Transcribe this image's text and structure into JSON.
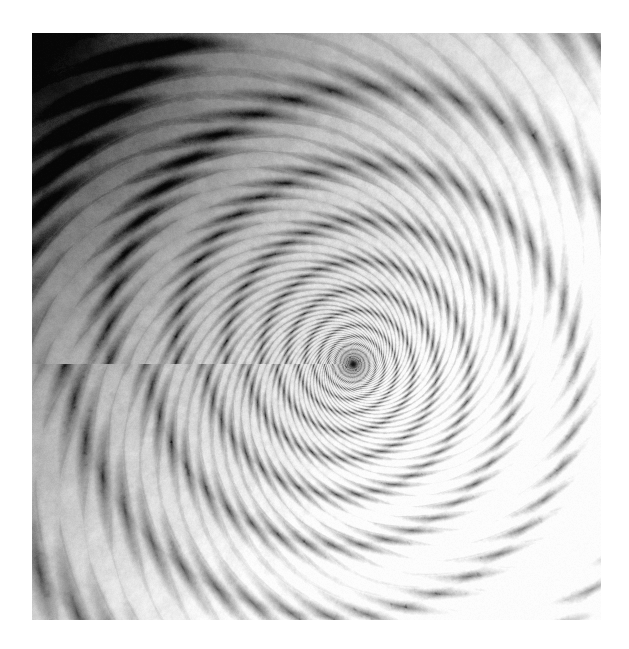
{
  "page": {
    "width": 629,
    "height": 649,
    "background_color": "#ffffff"
  },
  "figure": {
    "name": "mandelbrot-spiral",
    "frame": {
      "left": 32,
      "top": 33,
      "width": 569,
      "height": 587
    },
    "center_marker": {
      "x": 353,
      "y": 364,
      "label": "spiral-core"
    }
  },
  "chart_data": {
    "type": "heatmap",
    "title": "",
    "xlabel": "",
    "ylabel": "",
    "colormap": "grayscale",
    "render": {
      "algorithm": "mandelbrot-escape-time",
      "center_re": -0.743643887037151,
      "center_im": 0.13182590420533,
      "span_re": 5.5e-06,
      "max_iterations": 520,
      "escape_radius": 512,
      "smooth_shading": true,
      "spiral_arms": 36,
      "supersample": 2
    },
    "palette": {
      "stops": [
        {
          "pos": 0.0,
          "hex": "#060606"
        },
        {
          "pos": 0.1,
          "hex": "#1d1d1d"
        },
        {
          "pos": 0.22,
          "hex": "#4a4a4a"
        },
        {
          "pos": 0.34,
          "hex": "#6f6f6f"
        },
        {
          "pos": 0.46,
          "hex": "#8e8e8e"
        },
        {
          "pos": 0.58,
          "hex": "#a8a8a8"
        },
        {
          "pos": 0.7,
          "hex": "#c4c4c4"
        },
        {
          "pos": 0.82,
          "hex": "#dedede"
        },
        {
          "pos": 0.91,
          "hex": "#efefef"
        },
        {
          "pos": 1.0,
          "hex": "#fdfdfd"
        }
      ],
      "interior_hex": "#101010"
    },
    "regions": [
      {
        "name": "upper-left-dark-field",
        "mean_gray": 48,
        "description": "dark background with bright dendritic filaments and embedded spirals"
      },
      {
        "name": "mid-left-band",
        "mean_gray": 96,
        "description": "medium gray plateaus separated by filament chains"
      },
      {
        "name": "central-spiral",
        "mean_gray": 214,
        "description": "bright field with dark radiating spiral arms converging on a near-black core"
      },
      {
        "name": "lower-right-light-field",
        "mean_gray": 186,
        "description": "light gray plateaus with dark mini-Mandelbrot clusters"
      }
    ],
    "gradient": {
      "direction": "upper-left-dark-to-lower-right-light",
      "min_gray": 6,
      "max_gray": 253
    }
  }
}
